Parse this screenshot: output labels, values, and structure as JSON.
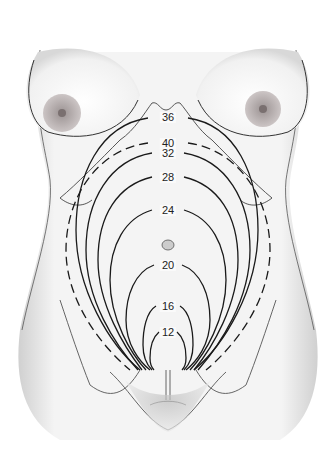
{
  "figure": {
    "labels": [
      {
        "week": "36",
        "x": 168,
        "y": 117,
        "style": "solid"
      },
      {
        "week": "40",
        "x": 168,
        "y": 143,
        "style": "dashed"
      },
      {
        "week": "32",
        "x": 168,
        "y": 153,
        "style": "solid"
      },
      {
        "week": "28",
        "x": 168,
        "y": 177,
        "style": "solid"
      },
      {
        "week": "24",
        "x": 168,
        "y": 210,
        "style": "solid"
      },
      {
        "week": "20",
        "x": 168,
        "y": 265,
        "style": "solid"
      },
      {
        "week": "16",
        "x": 168,
        "y": 306,
        "style": "solid"
      },
      {
        "week": "12",
        "x": 168,
        "y": 332,
        "style": "solid"
      }
    ],
    "colors": {
      "line": "#1a1a1a",
      "skin_shade": "#d8d8d8",
      "areola": "#9a9090",
      "background": "#ffffff"
    }
  }
}
